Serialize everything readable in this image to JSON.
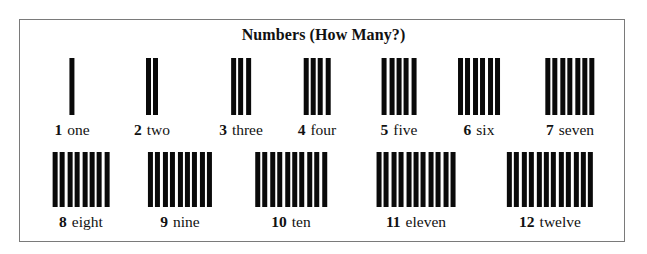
{
  "title": "Numbers (How Many?)",
  "colors": {
    "bar": "#0a0a0a",
    "frame": "#7a7a7a",
    "background": "#ffffff"
  },
  "rows": [
    {
      "name": "top",
      "items": [
        {
          "count": 1,
          "numeral": "1",
          "word": "one",
          "center_x": 72
        },
        {
          "count": 2,
          "numeral": "2",
          "word": "two",
          "center_x": 152
        },
        {
          "count": 3,
          "numeral": "3",
          "word": "three",
          "center_x": 241
        },
        {
          "count": 4,
          "numeral": "4",
          "word": "four",
          "center_x": 317
        },
        {
          "count": 5,
          "numeral": "5",
          "word": "five",
          "center_x": 399
        },
        {
          "count": 6,
          "numeral": "6",
          "word": "six",
          "center_x": 479
        },
        {
          "count": 7,
          "numeral": "7",
          "word": "seven",
          "center_x": 570
        }
      ]
    },
    {
      "name": "bottom",
      "items": [
        {
          "count": 8,
          "numeral": "8",
          "word": "eight",
          "center_x": 81
        },
        {
          "count": 9,
          "numeral": "9",
          "word": "nine",
          "center_x": 180
        },
        {
          "count": 10,
          "numeral": "10",
          "word": "ten",
          "center_x": 291
        },
        {
          "count": 11,
          "numeral": "11",
          "word": "eleven",
          "center_x": 416
        },
        {
          "count": 12,
          "numeral": "12",
          "word": "twelve",
          "center_x": 550
        }
      ]
    }
  ]
}
